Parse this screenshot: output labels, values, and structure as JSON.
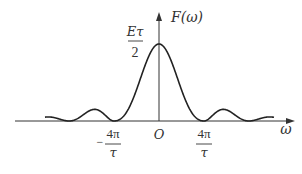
{
  "chart_data": {
    "type": "line",
    "title": "",
    "function": "F(ω) = (Eτ/2) · Sa²(ωτ/4)",
    "xlabel": "ω",
    "ylabel": "F(ω)",
    "origin_label": "O",
    "peak_label": {
      "numerator": "Eτ",
      "denominator": "2"
    },
    "x_ticks": [
      {
        "value_units_4pi_over_tau": -1,
        "sign": "−",
        "numerator": "4π",
        "denominator": "τ"
      },
      {
        "value_units_4pi_over_tau": 1,
        "sign": "",
        "numerator": "4π",
        "denominator": "τ"
      }
    ],
    "x_range_units_4pi_over_tau": [
      -2.5,
      2.5
    ],
    "peak_value": "Eτ/2",
    "zeros_units_4pi_over_tau": [
      -2,
      -1,
      1,
      2
    ],
    "grid": false,
    "legend": null,
    "series": [
      {
        "name": "F(ω)",
        "color": "#222222",
        "shape": "sinc-squared"
      }
    ]
  },
  "layout": {
    "origin_x": 159,
    "axis_y": 121,
    "peak_y": 44,
    "px_per_unit": 45,
    "curve_x_min": 45,
    "curve_x_max": 274,
    "axis_x_start": 15,
    "axis_x_end": 294,
    "yaxis_top": 12
  },
  "labels": {
    "y_axis": "F(ω)",
    "x_axis": "ω",
    "origin": "O",
    "peak_num": "Eτ",
    "peak_den": "2",
    "tick_neg_sign": "−",
    "tick_neg_num": "4π",
    "tick_neg_den": "τ",
    "tick_pos_num": "4π",
    "tick_pos_den": "τ"
  }
}
